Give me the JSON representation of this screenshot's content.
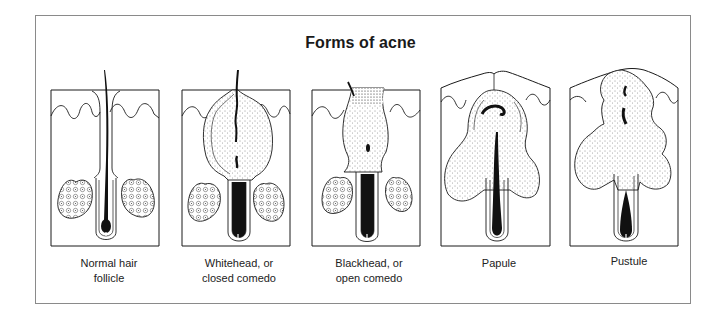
{
  "figure": {
    "title": "Forms of acne",
    "panels": [
      {
        "id": "normal",
        "caption_line1": "Normal hair",
        "caption_line2": "follicle"
      },
      {
        "id": "whitehead",
        "caption_line1": "Whitehead, or",
        "caption_line2": "closed comedo"
      },
      {
        "id": "blackhead",
        "caption_line1": "Blackhead, or",
        "caption_line2": "open comedo"
      },
      {
        "id": "papule",
        "caption_line1": "Papule",
        "caption_line2": ""
      },
      {
        "id": "pustule",
        "caption_line1": "Pustule",
        "caption_line2": ""
      }
    ]
  },
  "colors": {
    "line": "#1a1a1a",
    "frame": "#8a8a8a",
    "background": "#ffffff"
  }
}
